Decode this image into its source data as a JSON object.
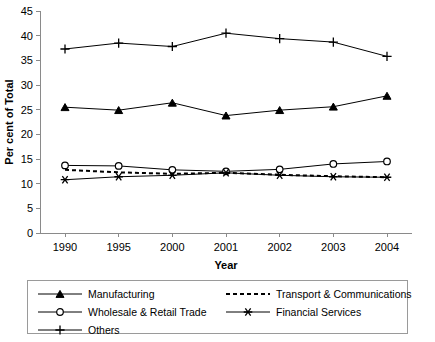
{
  "chart_data": {
    "type": "line",
    "title": "",
    "xlabel": "Year",
    "ylabel": "Per cent of Total",
    "x": [
      "1990",
      "1995",
      "2000",
      "2001",
      "2002",
      "2003",
      "2004"
    ],
    "categories": [
      "1990",
      "1995",
      "2000",
      "2001",
      "2002",
      "2003",
      "2004"
    ],
    "xlim": [
      0,
      6
    ],
    "ylim": [
      0,
      45
    ],
    "yticks": [
      "0",
      "5",
      "10",
      "15",
      "20",
      "25",
      "30",
      "35",
      "40",
      "45"
    ],
    "grid": false,
    "legend_position": "bottom",
    "series": [
      {
        "name": "Manufacturing",
        "marker": "filled-triangle",
        "linestyle": "solid",
        "values": [
          25.5,
          24.9,
          26.4,
          23.8,
          24.9,
          25.6,
          27.8
        ]
      },
      {
        "name": "Wholesale & Retail Trade",
        "marker": "open-circle",
        "linestyle": "solid",
        "values": [
          13.7,
          13.6,
          12.8,
          12.5,
          12.9,
          14.0,
          14.5
        ]
      },
      {
        "name": "Others",
        "marker": "plus",
        "linestyle": "solid",
        "values": [
          37.3,
          38.5,
          37.8,
          40.5,
          39.4,
          38.7,
          35.8
        ]
      },
      {
        "name": "Transport & Communications",
        "marker": "none",
        "linestyle": "dashed",
        "values": [
          12.8,
          12.3,
          12.0,
          12.2,
          11.8,
          11.5,
          11.3
        ]
      },
      {
        "name": "Financial Services",
        "marker": "asterisk",
        "linestyle": "solid",
        "values": [
          10.8,
          11.4,
          11.7,
          12.2,
          11.7,
          11.4,
          11.3
        ]
      }
    ]
  },
  "legend": {
    "items": [
      {
        "label": "Manufacturing",
        "marker": "filled-triangle",
        "linestyle": "solid"
      },
      {
        "label": "Transport & Communications",
        "marker": "none",
        "linestyle": "dashed"
      },
      {
        "label": "Wholesale & Retail Trade",
        "marker": "open-circle",
        "linestyle": "solid"
      },
      {
        "label": "Financial Services",
        "marker": "asterisk",
        "linestyle": "solid"
      },
      {
        "label": "Others",
        "marker": "plus",
        "linestyle": "solid"
      }
    ]
  },
  "colors": {
    "ink": "#000000",
    "axis": "#8a8a8a",
    "background": "#ffffff"
  }
}
